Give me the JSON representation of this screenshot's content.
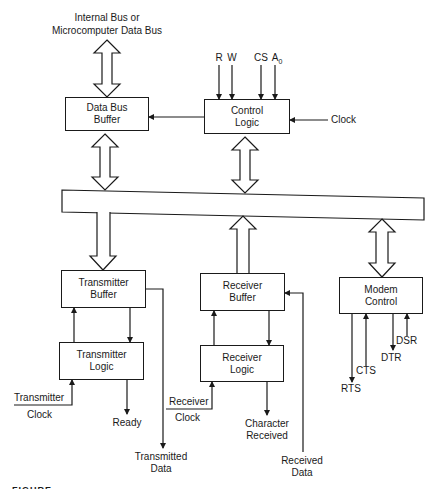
{
  "diagram": {
    "title_line1": "Internal Bus or",
    "title_line2": "Microcomputer Data Bus",
    "blocks": {
      "data_bus_buffer": {
        "line1": "Data Bus",
        "line2": "Buffer"
      },
      "control_logic": {
        "line1": "Control",
        "line2": "Logic"
      },
      "transmitter_buffer": {
        "line1": "Transmitter",
        "line2": "Buffer"
      },
      "transmitter_logic": {
        "line1": "Transmitter",
        "line2": "Logic"
      },
      "receiver_buffer": {
        "line1": "Receiver",
        "line2": "Buffer"
      },
      "receiver_logic": {
        "line1": "Receiver",
        "line2": "Logic"
      },
      "modem_control": {
        "line1": "Modem",
        "line2": "Control"
      }
    },
    "control_inputs": {
      "r": "R",
      "w": "W",
      "cs": "CS",
      "a": "A",
      "a_sub": "0"
    },
    "clock_label": "Clock",
    "transmitter_clock": {
      "line1": "Transmitter",
      "line2": "Clock"
    },
    "receiver_clock": {
      "line1": "Receiver",
      "line2": "Clock"
    },
    "ready_label": "Ready",
    "transmitted_data": {
      "line1": "Transmitted",
      "line2": "Data"
    },
    "character_received": {
      "line1": "Character",
      "line2": "Received"
    },
    "received_data": {
      "line1": "Received",
      "line2": "Data"
    },
    "modem_signals": {
      "rts": "RTS",
      "cts": "CTS",
      "dtr": "DTR",
      "dsr": "DSR"
    },
    "footer_fragment": "FIGURE"
  }
}
